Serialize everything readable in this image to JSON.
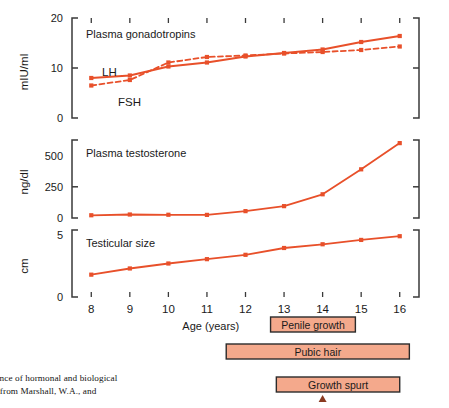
{
  "figure": {
    "xlabel": "Age (years)",
    "x_ticks": [
      8,
      9,
      10,
      11,
      12,
      13,
      14,
      15,
      16
    ],
    "accent_color": "#E8502A",
    "bar_fill": "#F4A98C",
    "bar_border": "#2B2B2B",
    "axis_color": "#3A3A3A"
  },
  "caption": {
    "line1": "quence of hormonal and biological",
    "line2": "wn from Marshall, W.A., and"
  },
  "bars": [
    {
      "label": "Penile growth",
      "start": 12.65,
      "end": 14.85
    },
    {
      "label": "Pubic hair",
      "start": 11.5,
      "end": 16.25
    },
    {
      "label": "Growth spurt",
      "start": 12.8,
      "end": 16.0
    }
  ],
  "marker": {
    "name": "peak-velocity-arrow",
    "at": 14.0
  },
  "chart_data": [
    {
      "type": "line",
      "title": "Plasma gonadotropins",
      "xlabel": "Age (years)",
      "ylabel": "mIU/ml",
      "x": [
        8,
        9,
        10,
        11,
        12,
        13,
        14,
        15,
        16
      ],
      "xlim": [
        7.5,
        16.5
      ],
      "ylim": [
        0,
        20
      ],
      "yticks": [
        0,
        10,
        20
      ],
      "grid": false,
      "legend": "inline-labels",
      "series": [
        {
          "name": "LH",
          "style": "solid",
          "values": [
            8.0,
            8.5,
            10.3,
            11.1,
            12.3,
            13.0,
            13.7,
            15.2,
            16.4
          ]
        },
        {
          "name": "FSH",
          "style": "dashed",
          "values": [
            6.5,
            7.6,
            11.1,
            12.2,
            12.5,
            12.9,
            13.2,
            13.6,
            14.3
          ]
        }
      ]
    },
    {
      "type": "line",
      "title": "Plasma testosterone",
      "xlabel": "Age (years)",
      "ylabel": "ng/dl",
      "x": [
        8,
        9,
        10,
        11,
        12,
        13,
        14,
        15,
        16
      ],
      "xlim": [
        7.5,
        16.5
      ],
      "ylim": [
        0,
        625
      ],
      "yticks": [
        0,
        250,
        500
      ],
      "grid": false,
      "series": [
        {
          "name": "Testosterone",
          "style": "solid",
          "values": [
            22,
            28,
            26,
            25,
            55,
            95,
            190,
            390,
            600
          ]
        }
      ]
    },
    {
      "type": "line",
      "title": "Testicular size",
      "xlabel": "Age (years)",
      "ylabel": "cm",
      "x": [
        8,
        9,
        10,
        11,
        12,
        13,
        14,
        15,
        16
      ],
      "xlim": [
        7.5,
        16.5
      ],
      "ylim": [
        0,
        5.4
      ],
      "yticks": [
        0,
        5
      ],
      "grid": false,
      "series": [
        {
          "name": "Testicular size",
          "style": "solid",
          "values": [
            1.8,
            2.3,
            2.7,
            3.05,
            3.4,
            3.95,
            4.25,
            4.6,
            4.9
          ]
        }
      ]
    }
  ]
}
